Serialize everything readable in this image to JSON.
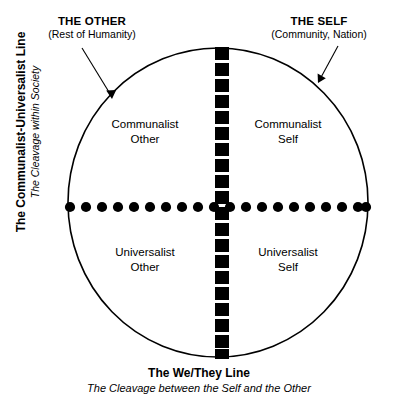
{
  "diagram": {
    "title_visible": false,
    "colors": {
      "stroke": "#000000",
      "background": "#ffffff",
      "text": "#000000"
    },
    "callouts": [
      {
        "id": "other",
        "title": "THE OTHER",
        "subtitle": "(Rest of Humanity)"
      },
      {
        "id": "self",
        "title": "THE SELF",
        "subtitle": "(Community, Nation)"
      }
    ],
    "axes": {
      "vertical": {
        "title": "The Communalist-Universalist Line",
        "subtitle": "The Cleavage within Society",
        "line_style": "dotted-round"
      },
      "horizontal": {
        "title": "The We/They Line",
        "subtitle": "The Cleavage between the Self and the Other",
        "line_style": "dashed-square"
      }
    },
    "quadrants": [
      {
        "id": "communalist-other",
        "line1": "Communalist",
        "line2": "Other"
      },
      {
        "id": "communalist-self",
        "line1": "Communalist",
        "line2": "Self"
      },
      {
        "id": "universalist-other",
        "line1": "Universalist",
        "line2": "Other"
      },
      {
        "id": "universalist-self",
        "line1": "Universalist",
        "line2": "Self"
      }
    ],
    "shapes": {
      "circle": {
        "cx": 218,
        "cy": 202.5,
        "rx": 150,
        "ry": 154.5
      },
      "vertical_divider": {
        "x": 222,
        "y_top": 48,
        "y_bottom": 358,
        "dash_count": 20
      },
      "horizontal_divider": {
        "y": 207,
        "x_left": 69,
        "x_right": 367,
        "dot_count": 20
      }
    }
  }
}
